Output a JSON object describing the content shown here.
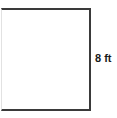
{
  "figure": {
    "type": "geometry-diagram",
    "background_color": "#ffffff",
    "shape": {
      "name": "rectangle",
      "stroke_color": "#3a3a3a",
      "fill_color": "#ffffff",
      "stroke_width_px": 2
    },
    "labels": {
      "right_side": "8 ft"
    },
    "measurements": {
      "side_length_value": "8",
      "side_length_unit": "ft"
    }
  }
}
